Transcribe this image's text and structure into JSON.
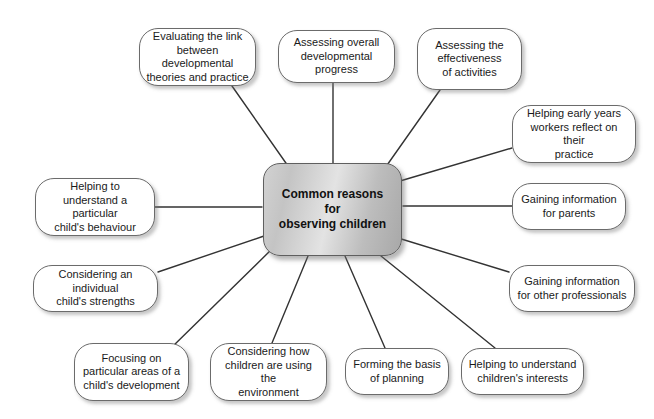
{
  "diagram": {
    "type": "radial-mind-map",
    "background_color": "#ffffff",
    "center": {
      "text_lines": [
        "Common reasons",
        "for",
        "observing children"
      ],
      "text": "Common reasons for observing children",
      "fill_color": "#cfcfcf",
      "border_color": "#5f5f5f",
      "x": 263,
      "y": 163,
      "width": 139,
      "height": 93
    },
    "node_style": {
      "fill_color": "#ffffff",
      "border_color": "#6b6b6b",
      "text_color": "#1a1a1a",
      "shadow_color": "#787878"
    },
    "connector_color": "#333333",
    "nodes": [
      {
        "id": "evaluating-the-link",
        "text": "Evaluating the link between developmental theories and practice",
        "lines": [
          "Evaluating the link",
          "between developmental",
          "theories and practice"
        ],
        "x": 139,
        "y": 28,
        "width": 117,
        "height": 58,
        "anchor_x": 232,
        "anchor_y": 86,
        "center_x": 288,
        "center_y": 166
      },
      {
        "id": "assessing-overall-progress",
        "text": "Assessing overall developmental progress",
        "lines": [
          "Assessing overall",
          "developmental progress"
        ],
        "x": 278,
        "y": 30,
        "width": 117,
        "height": 53,
        "anchor_x": 333,
        "anchor_y": 83,
        "center_x": 333,
        "center_y": 163
      },
      {
        "id": "assessing-effectiveness",
        "text": "Assessing the effectiveness of activities",
        "lines": [
          "Assessing the",
          "effectiveness",
          "of activities"
        ],
        "x": 417,
        "y": 28,
        "width": 105,
        "height": 62,
        "anchor_x": 440,
        "anchor_y": 90,
        "center_x": 385,
        "center_y": 168
      },
      {
        "id": "helping-early-years-workers",
        "text": "Helping early years workers reflect on their practice",
        "lines": [
          "Helping early years",
          "workers reflect on their",
          "practice"
        ],
        "x": 512,
        "y": 105,
        "width": 124,
        "height": 58,
        "anchor_x": 512,
        "anchor_y": 148,
        "center_x": 400,
        "center_y": 181
      },
      {
        "id": "gaining-information-parents",
        "text": "Gaining information for parents",
        "lines": [
          "Gaining information",
          "for parents"
        ],
        "x": 512,
        "y": 183,
        "width": 114,
        "height": 47,
        "anchor_x": 512,
        "anchor_y": 206,
        "center_x": 403,
        "center_y": 206
      },
      {
        "id": "gaining-information-professionals",
        "text": "Gaining information for other professionals",
        "lines": [
          "Gaining information",
          "for other professionals"
        ],
        "x": 509,
        "y": 265,
        "width": 126,
        "height": 47,
        "anchor_x": 509,
        "anchor_y": 272,
        "center_x": 398,
        "center_y": 238
      },
      {
        "id": "helping-understand-interests",
        "text": "Helping to understand children's interests",
        "lines": [
          "Helping to understand",
          "children's interests"
        ],
        "x": 461,
        "y": 348,
        "width": 123,
        "height": 47,
        "anchor_x": 495,
        "anchor_y": 348,
        "center_x": 381,
        "center_y": 256
      },
      {
        "id": "forming-basis-of-planning",
        "text": "Forming the basis of planning",
        "lines": [
          "Forming the basis",
          "of planning"
        ],
        "x": 345,
        "y": 348,
        "width": 104,
        "height": 47,
        "anchor_x": 385,
        "anchor_y": 348,
        "center_x": 345,
        "center_y": 256
      },
      {
        "id": "considering-how-children-use-environment",
        "text": "Considering how children are using the environment",
        "lines": [
          "Considering how",
          "children are using the",
          "environment"
        ],
        "x": 210,
        "y": 343,
        "width": 117,
        "height": 58,
        "anchor_x": 272,
        "anchor_y": 343,
        "center_x": 308,
        "center_y": 256
      },
      {
        "id": "focusing-on-particular-areas",
        "text": "Focusing on particular areas of a child's development",
        "lines": [
          "Focusing on",
          "particular areas of a",
          "child's development"
        ],
        "x": 74,
        "y": 343,
        "width": 115,
        "height": 58,
        "anchor_x": 170,
        "anchor_y": 349,
        "center_x": 272,
        "center_y": 249
      },
      {
        "id": "considering-individual-strengths",
        "text": "Considering an individual child's strengths",
        "lines": [
          "Considering an individual",
          "child's strengths"
        ],
        "x": 33,
        "y": 265,
        "width": 125,
        "height": 47,
        "anchor_x": 158,
        "anchor_y": 272,
        "center_x": 264,
        "center_y": 236
      },
      {
        "id": "helping-understand-behaviour",
        "text": "Helping to understand a particular child's behaviour",
        "lines": [
          "Helping to",
          "understand a particular",
          "child's behaviour"
        ],
        "x": 35,
        "y": 178,
        "width": 120,
        "height": 58,
        "anchor_x": 155,
        "anchor_y": 207,
        "center_x": 262,
        "center_y": 207
      }
    ]
  }
}
